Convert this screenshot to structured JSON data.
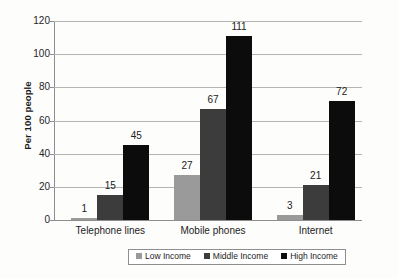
{
  "chart_data": {
    "type": "bar",
    "title": "",
    "subtitle": "",
    "xlabel": "",
    "ylabel": "Per 100 people",
    "ylim": [
      0,
      120
    ],
    "yticks": [
      0,
      20,
      40,
      60,
      80,
      100,
      120
    ],
    "grid": true,
    "legend_position": "bottom",
    "categories": [
      "Telephone lines",
      "Mobile phones",
      "Internet"
    ],
    "series": [
      {
        "name": "Low Income",
        "color": "#9a9a9a",
        "values": [
          1,
          27,
          3
        ]
      },
      {
        "name": "Middle Income",
        "color": "#3c3c3c",
        "values": [
          15,
          67,
          21
        ]
      },
      {
        "name": "High Income",
        "color": "#0c0c0c",
        "values": [
          45,
          111,
          72
        ]
      }
    ]
  },
  "axis": {
    "y_title": "Per 100 people",
    "y_ticks": [
      {
        "label": "120",
        "value": 120
      },
      {
        "label": "100",
        "value": 100
      },
      {
        "label": "80",
        "value": 80
      },
      {
        "label": "60",
        "value": 60
      },
      {
        "label": "40",
        "value": 40
      },
      {
        "label": "20",
        "value": 20
      },
      {
        "label": "0",
        "value": 0
      }
    ],
    "x_categories": [
      {
        "label": "Telephone lines"
      },
      {
        "label": "Mobile phones"
      },
      {
        "label": "Internet"
      }
    ]
  },
  "bar_labels": {
    "telephone": {
      "low": "1",
      "middle": "15",
      "high": "45"
    },
    "mobile": {
      "low": "27",
      "middle": "67",
      "high": "111"
    },
    "internet": {
      "low": "3",
      "middle": "21",
      "high": "72"
    }
  },
  "legend": {
    "items": [
      {
        "label": "Low Income",
        "color": "#9a9a9a"
      },
      {
        "label": "Middle Income",
        "color": "#3c3c3c"
      },
      {
        "label": "High Income",
        "color": "#0c0c0c"
      }
    ]
  }
}
